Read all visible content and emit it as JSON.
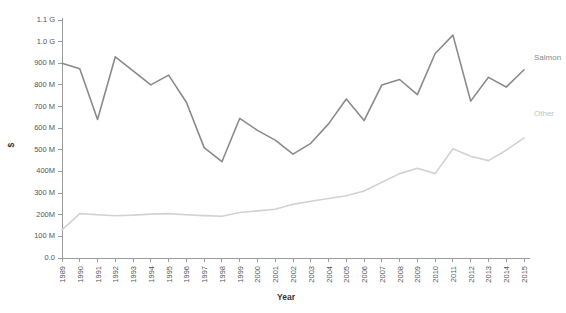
{
  "chart_data": {
    "type": "line",
    "title": "",
    "xlabel": "Year",
    "ylabel": "$",
    "grid": false,
    "legend_position": "right-inline-labels",
    "x": [
      1989,
      1990,
      1991,
      1992,
      1993,
      1994,
      1995,
      1996,
      1997,
      1998,
      1999,
      2000,
      2001,
      2002,
      2003,
      2004,
      2005,
      2006,
      2007,
      2008,
      2009,
      2010,
      2011,
      2012,
      2013,
      2014,
      2015
    ],
    "xtick_labels": [
      "1989",
      "1990",
      "1991",
      "1992",
      "1993",
      "1994",
      "1995",
      "1996",
      "1997",
      "1998",
      "1999",
      "2000",
      "2001",
      "2002",
      "2003",
      "2004",
      "2005",
      "2006",
      "2007",
      "2008",
      "2009",
      "2010",
      "2011",
      "2012",
      "2013",
      "2014",
      "2015"
    ],
    "ytick_labels": [
      "0.0",
      "100 M",
      "200M",
      "300 M",
      "400M",
      "500 M",
      "600 M",
      "700 M",
      "800 M",
      "900 M",
      "1.0 G",
      "1.1 G"
    ],
    "ytick_values": [
      0,
      100000000,
      200000000,
      300000000,
      400000000,
      500000000,
      600000000,
      700000000,
      800000000,
      900000000,
      1000000000,
      1100000000
    ],
    "ylim": [
      0,
      1100000000
    ],
    "series": [
      {
        "name": "Salmon",
        "color": "#8a8a8a",
        "label_color": "#8a8a8a",
        "values": [
          900000000,
          875000000,
          640000000,
          930000000,
          865000000,
          800000000,
          845000000,
          720000000,
          510000000,
          445000000,
          645000000,
          590000000,
          545000000,
          480000000,
          530000000,
          620000000,
          735000000,
          635000000,
          800000000,
          825000000,
          755000000,
          945000000,
          1030000000,
          725000000,
          835000000,
          790000000,
          870000000
        ]
      },
      {
        "name": "Other",
        "color": "#d2d2d2",
        "label_color": "#c2c2c2",
        "values": [
          130000000,
          205000000,
          200000000,
          195000000,
          198000000,
          203000000,
          205000000,
          200000000,
          196000000,
          193000000,
          210000000,
          218000000,
          225000000,
          248000000,
          262000000,
          275000000,
          288000000,
          310000000,
          350000000,
          390000000,
          415000000,
          390000000,
          505000000,
          470000000,
          450000000,
          498000000,
          555000000
        ]
      }
    ]
  }
}
